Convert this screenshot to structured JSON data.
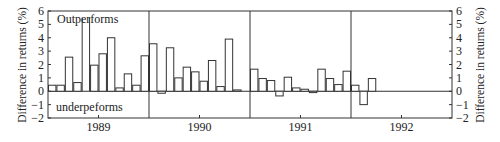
{
  "chart_data": {
    "type": "bar",
    "title": "",
    "xlabel": "",
    "ylabel": "Difference in returns (%)",
    "ylabel_right": "Difference in returns (%)",
    "ylim": [
      -2,
      6
    ],
    "yticks": [
      -2,
      -1,
      0,
      1,
      2,
      3,
      4,
      5,
      6
    ],
    "ytick_labels": [
      "−2",
      "−1",
      "0",
      "1",
      "2",
      "3",
      "4",
      "5",
      "6"
    ],
    "grid": false,
    "legend": "none",
    "annotations": [
      {
        "text": "Outperforms",
        "position": "top-left"
      },
      {
        "text": "underpeforms",
        "position": "bottom-left"
      }
    ],
    "year_labels": [
      "1989",
      "1990",
      "1991",
      "1992"
    ],
    "months_per_year": 12,
    "series": [
      {
        "name": "Monthly difference in returns",
        "values": [
          0.45,
          0.45,
          2.55,
          0.65,
          5.5,
          1.95,
          2.8,
          4.0,
          0.25,
          1.3,
          0.45,
          2.65,
          3.55,
          -0.15,
          3.25,
          1.0,
          1.8,
          1.45,
          0.75,
          2.3,
          0.35,
          3.9,
          0.1,
          null,
          1.65,
          0.95,
          0.8,
          -0.35,
          1.05,
          0.25,
          0.15,
          -0.1,
          1.65,
          0.95,
          0.5,
          1.5,
          0.45,
          -1.0,
          0.95
        ],
        "open_top_indices": [
          4
        ]
      }
    ]
  }
}
